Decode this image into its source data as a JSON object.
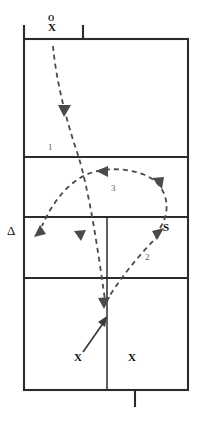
{
  "diagram": {
    "court": {
      "outline": {
        "x": 24,
        "y": 39,
        "width": 164,
        "height": 351
      },
      "dividers_y": [
        157,
        217,
        278
      ],
      "center_line_x": 107,
      "center_line_from_y": 217,
      "center_line_to_y": 390,
      "top_ticks_x": [
        24,
        83
      ],
      "top_tick_y_from": 25,
      "top_tick_y_to": 39,
      "bottom_tick_x": 135,
      "bottom_tick_y_from": 390,
      "bottom_tick_y_to": 407
    },
    "markers": [
      {
        "name": "marker-o-top",
        "label": "O",
        "role": "opponent-server"
      },
      {
        "name": "marker-x-top",
        "label": "X",
        "role": "server"
      },
      {
        "name": "marker-triangle-left",
        "label": "Δ",
        "role": "target-zone"
      },
      {
        "name": "marker-s-right",
        "label": "S",
        "role": "setter"
      },
      {
        "name": "marker-x-back-left",
        "label": "X",
        "role": "back-row-player"
      },
      {
        "name": "marker-x-back-right",
        "label": "X",
        "role": "back-row-player"
      }
    ],
    "path_labels": [
      {
        "name": "path-label-1",
        "text": "1",
        "description": "serve into the court"
      },
      {
        "name": "path-label-2",
        "text": "2",
        "description": "pass up to the setter"
      },
      {
        "name": "path-label-3",
        "text": "3",
        "description": "set across to the attack zone"
      }
    ],
    "colors": {
      "court_line": "#2b2b2b",
      "path_dashed": "#4a4a4a",
      "path_solid": "#3a3a3a",
      "marker_text": "#111111",
      "label_text": "#5a5a5a",
      "background": "#ffffff"
    }
  }
}
